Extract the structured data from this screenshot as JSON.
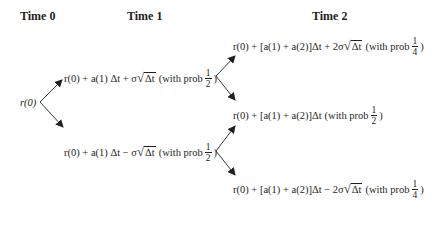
{
  "headers": {
    "time0": "Time 0",
    "time1": "Time 1",
    "time2": "Time 2"
  },
  "root": {
    "label": "r(0)"
  },
  "time1": {
    "up": {
      "prefix": "r(0) + a(1) Δt + σ",
      "radicand": "Δt",
      "prob_text": "(with prob",
      "num": "1",
      "den": "2",
      "close": ")"
    },
    "down": {
      "prefix": "r(0) + a(1) Δt − σ",
      "radicand": "Δt",
      "prob_text": "(with prob",
      "num": "1",
      "den": "2",
      "close": ")"
    }
  },
  "time2": {
    "up": {
      "prefix": "r(0) + [a(1) + a(2)]Δt + 2σ",
      "radicand": "Δt",
      "prob_text": "(with prob",
      "num": "1",
      "den": "4",
      "close": ")"
    },
    "mid": {
      "prefix": "r(0) + [a(1) + a(2)]Δt",
      "prob_text": "(with prob",
      "num": "1",
      "den": "2",
      "close": ")"
    },
    "down": {
      "prefix": "r(0) + [a(1) + a(2)]Δt − 2σ",
      "radicand": "Δt",
      "prob_text": "(with prob",
      "num": "1",
      "den": "4",
      "close": ")"
    }
  },
  "colors": {
    "text": "#231f20",
    "arrow": "#231f20"
  }
}
